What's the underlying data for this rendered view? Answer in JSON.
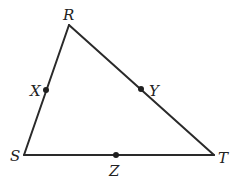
{
  "diagram": {
    "type": "triangle",
    "vertices": {
      "R": {
        "label": "R",
        "x": 69,
        "y": 25
      },
      "S": {
        "label": "S",
        "x": 24,
        "y": 155
      },
      "T": {
        "label": "T",
        "x": 214,
        "y": 155
      }
    },
    "points": {
      "X": {
        "label": "X",
        "on_side": "RS",
        "x": 46,
        "y": 90
      },
      "Y": {
        "label": "Y",
        "on_side": "RT",
        "x": 141,
        "y": 89
      },
      "Z": {
        "label": "Z",
        "on_side": "ST",
        "x": 116,
        "y": 155
      }
    },
    "sides": [
      "RS",
      "RT",
      "ST"
    ],
    "colors": {
      "stroke": "#2a2a2a",
      "point": "#1f1f1f",
      "label": "#222222",
      "background": "#ffffff"
    }
  }
}
